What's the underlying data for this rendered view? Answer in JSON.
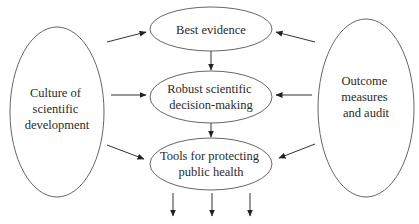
{
  "diagram": {
    "type": "flow",
    "nodes": {
      "culture": {
        "lines": [
          "Culture of",
          "scientific",
          "development"
        ]
      },
      "outcome": {
        "lines": [
          "Outcome",
          "measures",
          "and audit"
        ]
      },
      "evidence": {
        "lines": [
          "Best evidence"
        ]
      },
      "decision": {
        "lines": [
          "Robust scientific",
          "decision-making"
        ]
      },
      "tools": {
        "lines": [
          "Tools for protecting",
          "public health"
        ]
      }
    },
    "edges": [
      {
        "from": "culture",
        "to": "evidence"
      },
      {
        "from": "culture",
        "to": "decision"
      },
      {
        "from": "culture",
        "to": "tools"
      },
      {
        "from": "outcome",
        "to": "evidence"
      },
      {
        "from": "outcome",
        "to": "decision"
      },
      {
        "from": "outcome",
        "to": "tools"
      },
      {
        "from": "evidence",
        "to": "decision"
      },
      {
        "from": "decision",
        "to": "tools"
      },
      {
        "from": "tools",
        "to": "output-1"
      },
      {
        "from": "tools",
        "to": "output-2"
      },
      {
        "from": "tools",
        "to": "output-3"
      }
    ],
    "colors": {
      "stroke": "#555555",
      "text": "#2a2a2a",
      "background": "#ffffff"
    }
  }
}
